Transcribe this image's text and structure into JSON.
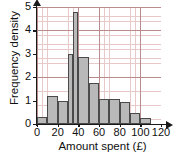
{
  "chart_data": {
    "type": "bar",
    "title": "",
    "xlabel": "Amount spent (£)",
    "ylabel": "Frequency density",
    "xlim": [
      0,
      120
    ],
    "ylim": [
      0,
      5
    ],
    "xticks": [
      0,
      20,
      40,
      60,
      80,
      100,
      120
    ],
    "xtick_labels": [
      "0",
      "20",
      "40",
      "60",
      "80",
      "100",
      "120"
    ],
    "yticks": [
      0,
      1,
      2,
      3,
      4,
      5
    ],
    "ytick_labels": [
      "0",
      "1",
      "2",
      "3",
      "4",
      "5"
    ],
    "grid": "major and minor gridlines, pink/red graph paper",
    "legend": "none",
    "bar_fill_color": "#b9b9b9",
    "bar_edge_color": "#4a4a4a",
    "grid_major_color": "#b98c8c",
    "grid_minor_color": "#e8c9c9",
    "axis_color": "#1a1a1a",
    "bins": [
      {
        "label": "0-10",
        "x0": 0,
        "x1": 10,
        "value": 0.3
      },
      {
        "label": "10-20",
        "x0": 10,
        "x1": 20,
        "value": 1.2
      },
      {
        "label": "20-30",
        "x0": 20,
        "x1": 30,
        "value": 1.0
      },
      {
        "label": "30-35",
        "x0": 30,
        "x1": 35,
        "value": 3.0
      },
      {
        "label": "35-40",
        "x0": 35,
        "x1": 40,
        "value": 4.8
      },
      {
        "label": "40-50",
        "x0": 40,
        "x1": 50,
        "value": 2.85
      },
      {
        "label": "50-60",
        "x0": 50,
        "x1": 60,
        "value": 1.75
      },
      {
        "label": "60-70",
        "x0": 60,
        "x1": 70,
        "value": 1.05
      },
      {
        "label": "70-80",
        "x0": 70,
        "x1": 80,
        "value": 1.05
      },
      {
        "label": "80-90",
        "x0": 80,
        "x1": 90,
        "value": 0.95
      },
      {
        "label": "90-100",
        "x0": 90,
        "x1": 100,
        "value": 0.45
      },
      {
        "label": "100-110",
        "x0": 100,
        "x1": 110,
        "value": 0.25
      }
    ]
  }
}
